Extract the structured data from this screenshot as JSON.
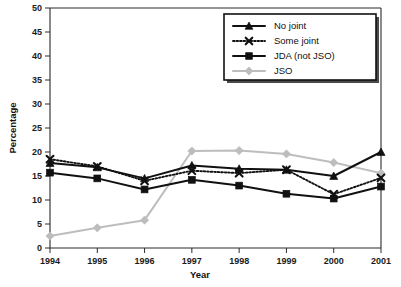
{
  "chart_data": {
    "type": "line",
    "title": "",
    "xlabel": "Year",
    "ylabel": "Percentage",
    "categories": [
      "1994",
      "1995",
      "1996",
      "1997",
      "1998",
      "1999",
      "2000",
      "2001"
    ],
    "x": [
      1994,
      1995,
      1996,
      1997,
      1998,
      1999,
      2000,
      2001
    ],
    "xlim": [
      1994,
      2001
    ],
    "ylim": [
      0,
      50
    ],
    "yticks": [
      0,
      5,
      10,
      15,
      20,
      25,
      30,
      35,
      40,
      45,
      50
    ],
    "ytick_labels": [
      "0",
      "5",
      "10",
      "15",
      "20",
      "25",
      "30",
      "35",
      "40",
      "45",
      "50"
    ],
    "grid": false,
    "legend_position": "top-right",
    "series": [
      {
        "name": "No joint",
        "marker": "triangle",
        "line_style": "solid",
        "color": "#111111",
        "values": [
          17.7,
          16.8,
          14.5,
          17.2,
          16.5,
          16.3,
          15.0,
          20.0
        ]
      },
      {
        "name": "Some joint",
        "marker": "x",
        "line_style": "dotted",
        "color": "#111111",
        "values": [
          18.5,
          17.0,
          14.0,
          16.1,
          15.6,
          16.3,
          11.2,
          14.6
        ]
      },
      {
        "name": "JDA (not JSO)",
        "marker": "square",
        "line_style": "solid",
        "color": "#111111",
        "values": [
          15.7,
          14.5,
          12.2,
          14.2,
          13.0,
          11.3,
          10.3,
          12.8
        ]
      },
      {
        "name": "JSO",
        "marker": "diamond",
        "line_style": "solid",
        "color": "#bdbdbd",
        "values": [
          2.5,
          4.2,
          5.8,
          20.2,
          20.3,
          19.6,
          17.8,
          15.6
        ]
      }
    ]
  },
  "figure": {
    "background_color": "#ffffff",
    "axis_color": "#2b2b2b"
  }
}
